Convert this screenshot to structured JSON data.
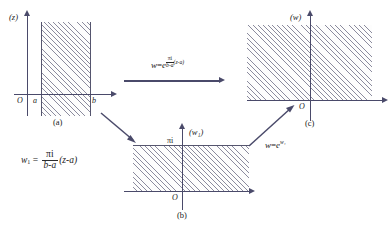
{
  "figure": {
    "type": "conformal-mapping-diagram",
    "caption": ""
  },
  "panel_a": {
    "plane_label": "(z)",
    "panel_label": "(a)",
    "origin_label": "O",
    "tick_left": "a",
    "tick_right": "b",
    "region": "vertical strip a < Re z < b"
  },
  "panel_b": {
    "plane_label": "(w₁)",
    "panel_label": "(b)",
    "origin_label": "O",
    "top_label": "πi",
    "region": "horizontal strip 0 < Im w₁ < π"
  },
  "panel_c": {
    "plane_label": "(w)",
    "panel_label": "(c)",
    "origin_label": "O",
    "region": "upper half plane Im w > 0"
  },
  "maps": {
    "top": {
      "lhs": "w",
      "eq": "=",
      "base": "e",
      "exp_num": "πi",
      "exp_den": "b-a",
      "exp_tail": "(z-a)"
    },
    "left": {
      "lhs": "w",
      "lhs_sub": "1",
      "eq": "=",
      "num": "πi",
      "den": "b-a",
      "tail": "(z-a)"
    },
    "right": {
      "lhs": "w",
      "eq": "=",
      "base": "e",
      "exp": "w₁"
    }
  },
  "colors": {
    "axis": "#4a4a6a",
    "hatch": "#8b8b9e",
    "edge": "#55556e",
    "text": "#1a1a1a"
  }
}
